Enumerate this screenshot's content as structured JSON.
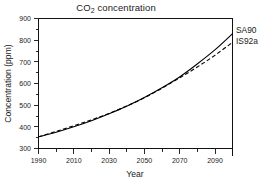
{
  "chart_data": {
    "type": "line",
    "title": "CO2 concentration",
    "title_prefix": "CO",
    "title_subscript": "2",
    "title_suffix": " concentration",
    "xlabel": "Year",
    "ylabel": "Concentration (ppm)",
    "xlim": [
      1990,
      2100
    ],
    "ylim": [
      300,
      900
    ],
    "x_major_ticks": [
      1990,
      2010,
      2030,
      2050,
      2070,
      2090
    ],
    "x_minor_ticks": [
      2000,
      2020,
      2040,
      2060,
      2080,
      2100
    ],
    "x_tick_labels": [
      "1990",
      "2010",
      "2030",
      "2050",
      "2070",
      "2090"
    ],
    "y_major_ticks": [
      300,
      400,
      500,
      600,
      700,
      800,
      900
    ],
    "y_minor_ticks": [
      350,
      450,
      550,
      650,
      750,
      850
    ],
    "y_tick_labels": [
      "300",
      "400",
      "500",
      "600",
      "700",
      "800",
      "900"
    ],
    "grid": false,
    "legend_position": "right-outside",
    "x": [
      1990,
      2000,
      2010,
      2020,
      2030,
      2040,
      2050,
      2060,
      2070,
      2080,
      2090,
      2100
    ],
    "series": [
      {
        "name": "SA90",
        "style": "solid",
        "color": "#000000",
        "values": [
          354,
          375,
          400,
          428,
          460,
          495,
          535,
          580,
          630,
          690,
          755,
          830
        ]
      },
      {
        "name": "IS92a",
        "style": "dashed",
        "color": "#000000",
        "values": [
          354,
          379,
          405,
          432,
          462,
          496,
          534,
          578,
          626,
          676,
          730,
          790
        ]
      }
    ],
    "legend": [
      {
        "label": "SA90"
      },
      {
        "label": "IS92a"
      }
    ]
  }
}
